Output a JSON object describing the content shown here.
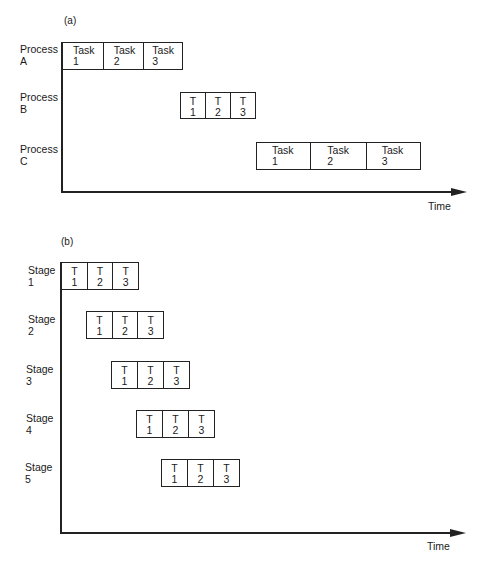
{
  "panel_a": {
    "label": "(a)",
    "axis_label": "Time",
    "rows": [
      {
        "name": "Process\nA",
        "tasks": [
          {
            "t": "Task",
            "n": "1"
          },
          {
            "t": "Task",
            "n": "2"
          },
          {
            "t": "Task",
            "n": "3"
          }
        ]
      },
      {
        "name": "Process\nB",
        "tasks": [
          {
            "t": "T",
            "n": "1"
          },
          {
            "t": "T",
            "n": "2"
          },
          {
            "t": "T",
            "n": "3"
          }
        ]
      },
      {
        "name": "Process\nC",
        "tasks": [
          {
            "t": "Task",
            "n": "1"
          },
          {
            "t": "Task",
            "n": "2"
          },
          {
            "t": "Task",
            "n": "3"
          }
        ]
      }
    ]
  },
  "panel_b": {
    "label": "(b)",
    "axis_label": "Time",
    "rows": [
      {
        "name": "Stage\n1",
        "tasks": [
          {
            "t": "T",
            "n": "1"
          },
          {
            "t": "T",
            "n": "2"
          },
          {
            "t": "T",
            "n": "3"
          }
        ]
      },
      {
        "name": "Stage\n2",
        "tasks": [
          {
            "t": "T",
            "n": "1"
          },
          {
            "t": "T",
            "n": "2"
          },
          {
            "t": "T",
            "n": "3"
          }
        ]
      },
      {
        "name": "Stage\n3",
        "tasks": [
          {
            "t": "T",
            "n": "1"
          },
          {
            "t": "T",
            "n": "2"
          },
          {
            "t": "T",
            "n": "3"
          }
        ]
      },
      {
        "name": "Stage\n4",
        "tasks": [
          {
            "t": "T",
            "n": "1"
          },
          {
            "t": "T",
            "n": "2"
          },
          {
            "t": "T",
            "n": "3"
          }
        ]
      },
      {
        "name": "Stage\n5",
        "tasks": [
          {
            "t": "T",
            "n": "1"
          },
          {
            "t": "T",
            "n": "2"
          },
          {
            "t": "T",
            "n": "3"
          }
        ]
      }
    ]
  }
}
